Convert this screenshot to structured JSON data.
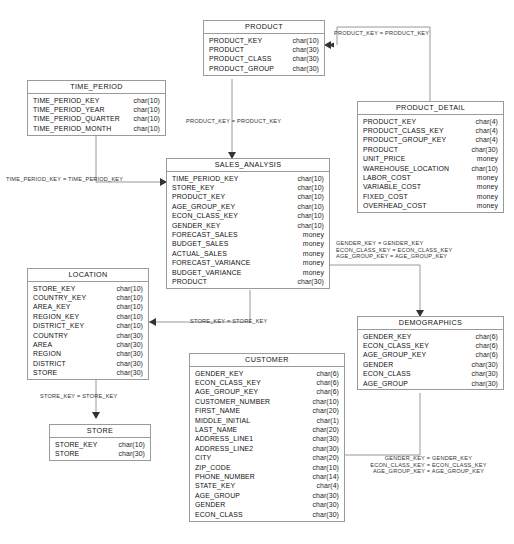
{
  "diagram": {
    "type": "er-diagram",
    "line_color": "#8d8d8d",
    "border_color": "#9a9a9a",
    "text_color": "#111111"
  },
  "entities": [
    {
      "id": "product",
      "name": "PRODUCT",
      "x": 203,
      "y": 20,
      "w": 122,
      "attributes": [
        {
          "name": "PRODUCT_KEY",
          "type": "char(10)"
        },
        {
          "name": "PRODUCT",
          "type": "char(30)"
        },
        {
          "name": "PRODUCT_CLASS",
          "type": "char(30)"
        },
        {
          "name": "PRODUCT_GROUP",
          "type": "char(30)"
        }
      ]
    },
    {
      "id": "time_period",
      "name": "TIME_PERIOD",
      "x": 27,
      "y": 80,
      "w": 139,
      "attributes": [
        {
          "name": "TIME_PERIOD_KEY",
          "type": "char(10)"
        },
        {
          "name": "TIME_PERIOD_YEAR",
          "type": "char(10)"
        },
        {
          "name": "TIME_PERIOD_QUARTER",
          "type": "char(10)"
        },
        {
          "name": "TIME_PERIOD_MONTH",
          "type": "char(10)"
        }
      ]
    },
    {
      "id": "product_detail",
      "name": "PRODUCT_DETAIL",
      "x": 357,
      "y": 101,
      "w": 147,
      "attributes": [
        {
          "name": "PRODUCT_KEY",
          "type": "char(4)"
        },
        {
          "name": "PRODUCT_CLASS_KEY",
          "type": "char(4)"
        },
        {
          "name": "PRODUCT_GROUP_KEY",
          "type": "char(4)"
        },
        {
          "name": "PRODUCT",
          "type": "char(30)"
        },
        {
          "name": "UNIT_PRICE",
          "type": "money"
        },
        {
          "name": "WAREHOUSE_LOCATION",
          "type": "char(10)"
        },
        {
          "name": "LABOR_COST",
          "type": "money"
        },
        {
          "name": "VARIABLE_COST",
          "type": "money"
        },
        {
          "name": "FIXED_COST",
          "type": "money"
        },
        {
          "name": "OVERHEAD_COST",
          "type": "money"
        }
      ]
    },
    {
      "id": "sales_analysis",
      "name": "SALES_ANALYSIS",
      "x": 166,
      "y": 158,
      "w": 164,
      "attributes": [
        {
          "name": "TIME_PERIOD_KEY",
          "type": "char(10)"
        },
        {
          "name": "STORE_KEY",
          "type": "char(10)"
        },
        {
          "name": "PRODUCT_KEY",
          "type": "char(10)"
        },
        {
          "name": "AGE_GROUP_KEY",
          "type": "char(10)"
        },
        {
          "name": "ECON_CLASS_KEY",
          "type": "char(10)"
        },
        {
          "name": "GENDER_KEY",
          "type": "char(10)"
        },
        {
          "name": "FORECAST_SALES",
          "type": "money"
        },
        {
          "name": "BUDGET_SALES",
          "type": "money"
        },
        {
          "name": "ACTUAL_SALES",
          "type": "money"
        },
        {
          "name": "FORECAST_VARIANCE",
          "type": "money"
        },
        {
          "name": "BUDGET_VARIANCE",
          "type": "money"
        },
        {
          "name": "PRODUCT",
          "type": "char(30)"
        }
      ]
    },
    {
      "id": "location",
      "name": "LOCATION",
      "x": 27,
      "y": 268,
      "w": 122,
      "attributes": [
        {
          "name": "STORE_KEY",
          "type": "char(10)"
        },
        {
          "name": "COUNTRY_KEY",
          "type": "char(10)"
        },
        {
          "name": "AREA_KEY",
          "type": "char(10)"
        },
        {
          "name": "REGION_KEY",
          "type": "char(10)"
        },
        {
          "name": "DISTRICT_KEY",
          "type": "char(10)"
        },
        {
          "name": "COUNTRY",
          "type": "char(30)"
        },
        {
          "name": "AREA",
          "type": "char(30)"
        },
        {
          "name": "REGION",
          "type": "char(30)"
        },
        {
          "name": "DISTRICT",
          "type": "char(30)"
        },
        {
          "name": "STORE",
          "type": "char(30)"
        }
      ]
    },
    {
      "id": "demographics",
      "name": "DEMOGRAPHICS",
      "x": 357,
      "y": 316,
      "w": 147,
      "attributes": [
        {
          "name": "GENDER_KEY",
          "type": "char(6)"
        },
        {
          "name": "ECON_CLASS_KEY",
          "type": "char(6)"
        },
        {
          "name": "AGE_GROUP_KEY",
          "type": "char(6)"
        },
        {
          "name": "GENDER",
          "type": "char(30)"
        },
        {
          "name": "ECON_CLASS",
          "type": "char(30)"
        },
        {
          "name": "AGE_GROUP",
          "type": "char(30)"
        }
      ]
    },
    {
      "id": "customer",
      "name": "CUSTOMER",
      "x": 189,
      "y": 353,
      "w": 156,
      "attributes": [
        {
          "name": "GENDER_KEY",
          "type": "char(6)"
        },
        {
          "name": "ECON_CLASS_KEY",
          "type": "char(6)"
        },
        {
          "name": "AGE_GROUP_KEY",
          "type": "char(6)"
        },
        {
          "name": "CUSTOMER_NUMBER",
          "type": "char(10)"
        },
        {
          "name": "FIRST_NAME",
          "type": "char(20)"
        },
        {
          "name": "MIDDLE_INITIAL",
          "type": "char(1)"
        },
        {
          "name": "LAST_NAME",
          "type": "char(20)"
        },
        {
          "name": "ADDRESS_LINE1",
          "type": "char(30)"
        },
        {
          "name": "ADDRESS_LINE2",
          "type": "char(30)"
        },
        {
          "name": "CITY",
          "type": "char(20)"
        },
        {
          "name": "ZIP_CODE",
          "type": "char(10)"
        },
        {
          "name": "PHONE_NUMBER",
          "type": "char(14)"
        },
        {
          "name": "STATE_KEY",
          "type": "char(4)"
        },
        {
          "name": "AGE_GROUP",
          "type": "char(30)"
        },
        {
          "name": "GENDER",
          "type": "char(30)"
        },
        {
          "name": "ECON_CLASS",
          "type": "char(30)"
        }
      ]
    },
    {
      "id": "store",
      "name": "STORE",
      "x": 49,
      "y": 424,
      "w": 102,
      "attributes": [
        {
          "name": "STORE_KEY",
          "type": "char(10)"
        },
        {
          "name": "STORE",
          "type": "char(30)"
        }
      ]
    }
  ],
  "relationships": [
    {
      "id": "rel-product-detail-top",
      "text": "PRODUCT_KEY = PRODUCT_KEY",
      "x": 334,
      "y": 30,
      "w": 170,
      "align": "left"
    },
    {
      "id": "rel-product-sales",
      "text": "PRODUCT_KEY = PRODUCT_KEY",
      "x": 186,
      "y": 118,
      "w": 130,
      "align": "left"
    },
    {
      "id": "rel-time-period-sales",
      "text": "TIME_PERIOD_KEY = TIME_PERIOD_KEY",
      "x": 6,
      "y": 176,
      "w": 150,
      "align": "left"
    },
    {
      "id": "rel-demographics-sales",
      "text": "GENDER_KEY = GENDER_KEY\nECON_CLASS_KEY = ECON_CLASS_KEY\nAGE_GROUP_KEY = AGE_GROUP_KEY",
      "x": 336,
      "y": 240,
      "w": 170,
      "align": "left"
    },
    {
      "id": "rel-location-sales",
      "text": "STORE_KEY = STORE_KEY",
      "x": 190,
      "y": 318,
      "w": 120,
      "align": "left"
    },
    {
      "id": "rel-location-store",
      "text": "STORE_KEY = STORE_KEY",
      "x": 40,
      "y": 393,
      "w": 120,
      "align": "left"
    },
    {
      "id": "rel-customer-demographics",
      "text": "GENDER_KEY = GENDER_KEY\nECON_CLASS_KEY = ECON_CLASS_KEY\nAGE_GROUP_KEY = AGE_GROUP_KEY",
      "x": 351,
      "y": 455,
      "w": 155,
      "align": "center"
    }
  ]
}
